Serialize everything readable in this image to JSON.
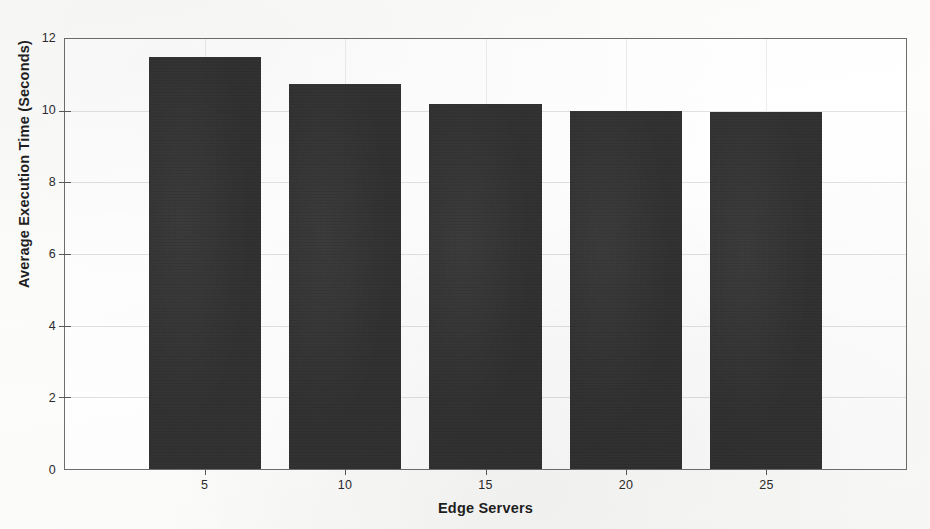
{
  "chart_data": {
    "type": "bar",
    "title": "",
    "subtitle": "",
    "xlabel": "Edge Servers",
    "ylabel": "Average Execution Time (Seconds)",
    "categories": [
      "5",
      "10",
      "15",
      "20",
      "25"
    ],
    "values": [
      11.5,
      10.75,
      10.2,
      10.0,
      9.95
    ],
    "series": [
      {
        "name": "Average Execution Time",
        "values": [
          11.5,
          10.75,
          10.2,
          10.0,
          9.95
        ]
      }
    ],
    "xlim": [
      0,
      30
    ],
    "ylim": [
      0,
      12
    ],
    "yticks": [
      "0",
      "2",
      "4",
      "6",
      "8",
      "10",
      "12"
    ],
    "ytick_values": [
      0,
      2,
      4,
      6,
      8,
      10,
      12
    ],
    "xticks": [
      "5",
      "10",
      "15",
      "20",
      "25"
    ],
    "xtick_values": [
      5,
      10,
      15,
      20,
      25
    ],
    "grid": true,
    "legend": false,
    "legend_position": "none",
    "bar_color": "#2e2e2e",
    "axis_color": "#6d6d6d",
    "grid_color": "#e2e2e2",
    "background_color": "#ffffff",
    "annotations": []
  },
  "figure": {
    "caption": ""
  }
}
